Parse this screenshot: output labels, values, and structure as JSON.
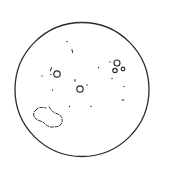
{
  "diagram": {
    "type": "solar-disk-sketch",
    "colors": {
      "background": "#ffffff",
      "stroke": "#2a2a2a"
    },
    "disk": {
      "cx": 82,
      "cy": 89.5,
      "r": 67,
      "stroke_width": 1.3
    },
    "rings": [
      {
        "id": "left-spot",
        "cx": 57,
        "cy": 74,
        "r": 3.2
      },
      {
        "id": "center-spot",
        "cx": 80,
        "cy": 89,
        "r": 3.2
      },
      {
        "id": "right-spot-1",
        "cx": 117,
        "cy": 63,
        "r": 3.0
      },
      {
        "id": "right-spot-2",
        "cx": 115,
        "cy": 70.5,
        "r": 2.2
      },
      {
        "id": "right-spot-3",
        "cx": 123,
        "cy": 69,
        "r": 1.8
      }
    ],
    "ticks": [
      {
        "x1": 51.5,
        "y1": 67.5,
        "x2": 50.5,
        "y2": 71
      },
      {
        "x1": 72,
        "y1": 49.5,
        "x2": 72.5,
        "y2": 52.5
      },
      {
        "x1": 122,
        "y1": 100,
        "x2": 124,
        "y2": 100
      },
      {
        "x1": 75,
        "y1": 79.5,
        "x2": 75,
        "y2": 81.5
      }
    ],
    "dots": [
      {
        "cx": 67,
        "cy": 41.5
      },
      {
        "cx": 42,
        "cy": 76
      },
      {
        "cx": 51,
        "cy": 74.5
      },
      {
        "cx": 52.5,
        "cy": 90
      },
      {
        "cx": 87,
        "cy": 85
      },
      {
        "cx": 98.5,
        "cy": 67.5
      },
      {
        "cx": 110,
        "cy": 62
      },
      {
        "cx": 112,
        "cy": 78.5
      },
      {
        "cx": 124,
        "cy": 86.5
      },
      {
        "cx": 69.5,
        "cy": 106.5
      },
      {
        "cx": 91,
        "cy": 106.5
      }
    ],
    "blob": {
      "path": "M36,110 C38,107 43,107 46,108 M49,107 C51,109 52,112 55,113 C59,114 62,116 62,119 C63,122 61,125 59,126 C57,127 53,127 50,127 C47,126 45,124 43,122 C40,121 37,120 35,118 C33,116 33,112 36,110",
      "dash": "3 1.6"
    }
  }
}
